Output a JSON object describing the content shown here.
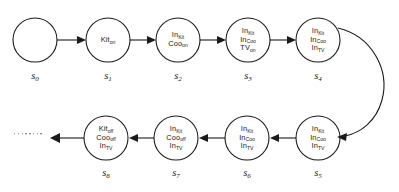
{
  "diagram": {
    "type": "state-transition-graph",
    "background_color": "#ffffff",
    "stroke_color": "#1a1a1a",
    "nodes": [
      {
        "id": "s0",
        "label": "s",
        "index": "0",
        "cx": 35,
        "cy": 40,
        "r": 22,
        "propositions": []
      },
      {
        "id": "s1",
        "label": "s",
        "index": "1",
        "cx": 108,
        "cy": 40,
        "r": 22,
        "propositions": [
          {
            "name": "Kit",
            "sub": "on"
          }
        ]
      },
      {
        "id": "s2",
        "label": "s",
        "index": "2",
        "cx": 178,
        "cy": 40,
        "r": 22,
        "propositions": [
          {
            "name": "In",
            "sub": "Kit"
          },
          {
            "name": "Coo",
            "sub": "on"
          }
        ]
      },
      {
        "id": "s3",
        "label": "s",
        "index": "3",
        "cx": 248,
        "cy": 40,
        "r": 22,
        "propositions": [
          {
            "name": "In",
            "sub": "Kit"
          },
          {
            "name": "In",
            "sub": "Coo"
          },
          {
            "name": "TV",
            "sub": "on"
          }
        ]
      },
      {
        "id": "s4",
        "label": "s",
        "index": "4",
        "cx": 318,
        "cy": 40,
        "r": 22,
        "propositions": [
          {
            "name": "In",
            "sub": "Kit"
          },
          {
            "name": "In",
            "sub": "Coo"
          },
          {
            "name": "In",
            "sub": "TV"
          }
        ]
      },
      {
        "id": "s5",
        "label": "s",
        "index": "5",
        "cx": 318,
        "cy": 138,
        "r": 22,
        "propositions": [
          {
            "name": "In",
            "sub": "Kit"
          },
          {
            "name": "In",
            "sub": "Coo"
          },
          {
            "name": "In",
            "sub": "TV"
          }
        ]
      },
      {
        "id": "s6",
        "label": "s",
        "index": "6",
        "cx": 247,
        "cy": 138,
        "r": 22,
        "propositions": [
          {
            "name": "In",
            "sub": "Kit"
          },
          {
            "name": "In",
            "sub": "Coo"
          },
          {
            "name": "In",
            "sub": "TV"
          }
        ]
      },
      {
        "id": "s7",
        "label": "s",
        "index": "7",
        "cx": 176,
        "cy": 138,
        "r": 22,
        "propositions": [
          {
            "name": "In",
            "sub": "Kit"
          },
          {
            "name": "Coo",
            "sub": "off"
          },
          {
            "name": "In",
            "sub": "TV"
          }
        ]
      },
      {
        "id": "s8",
        "label": "s",
        "index": "8",
        "cx": 106,
        "cy": 138,
        "r": 22,
        "propositions": [
          {
            "name": "Kit",
            "sub": "off"
          },
          {
            "name": "Coo",
            "sub": "off"
          },
          {
            "name": "In",
            "sub": "TV"
          }
        ]
      }
    ],
    "edges": [
      {
        "from": "s0",
        "to": "s1",
        "shape": "straight",
        "direction": "right"
      },
      {
        "from": "s1",
        "to": "s2",
        "shape": "straight",
        "direction": "right"
      },
      {
        "from": "s2",
        "to": "s3",
        "shape": "straight",
        "direction": "right"
      },
      {
        "from": "s3",
        "to": "s4",
        "shape": "straight",
        "direction": "right"
      },
      {
        "from": "s4",
        "to": "s5",
        "shape": "curved",
        "direction": "down-left"
      },
      {
        "from": "s5",
        "to": "s6",
        "shape": "straight",
        "direction": "left"
      },
      {
        "from": "s6",
        "to": "s7",
        "shape": "straight",
        "direction": "left"
      },
      {
        "from": "s7",
        "to": "s8",
        "shape": "straight",
        "direction": "left"
      },
      {
        "from": "s8",
        "to": "continuation",
        "shape": "straight",
        "direction": "left"
      }
    ],
    "continuation": {
      "name": "ellipsis",
      "dot_count": 8,
      "x": 14,
      "y": 134
    }
  }
}
